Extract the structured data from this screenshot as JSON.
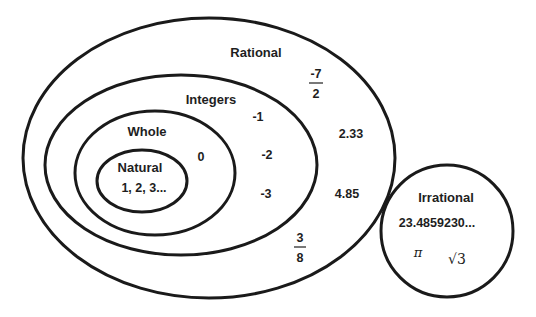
{
  "diagram": {
    "type": "venn",
    "stroke_color": "#1a1a1a",
    "background": "#ffffff",
    "sets": {
      "rational": {
        "label": "Rational",
        "examples": {
          "frac1_num": "-7",
          "frac1_den": "2",
          "decimal1": "2.33",
          "decimal2": "4.85",
          "frac2_num": "3",
          "frac2_den": "8"
        }
      },
      "integers": {
        "label": "Integers",
        "examples": [
          "-1",
          "-2",
          "-3"
        ]
      },
      "whole": {
        "label": "Whole",
        "examples": [
          "0"
        ]
      },
      "natural": {
        "label": "Natural",
        "examples": "1, 2, 3..."
      },
      "irrational": {
        "label": "Irrational",
        "examples": {
          "decimal": "23.4859230...",
          "pi": "π",
          "sqrt_symbol": "√",
          "sqrt_value": "3"
        }
      }
    }
  }
}
